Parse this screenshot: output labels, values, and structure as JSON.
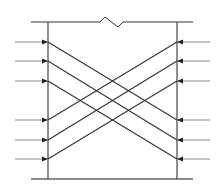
{
  "diagram": {
    "colors": {
      "line": "#333333",
      "stub": "#888888",
      "background": "#ffffff"
    },
    "rows": 6,
    "left_inputs": [
      "row-1",
      "row-2",
      "row-3",
      "row-4",
      "row-5",
      "row-6"
    ],
    "right_inputs": [
      "row-1",
      "row-2",
      "row-3",
      "row-4",
      "row-5",
      "row-6"
    ],
    "connections": [
      {
        "from": "left-row-1",
        "to": "right-row-4"
      },
      {
        "from": "left-row-2",
        "to": "right-row-5"
      },
      {
        "from": "left-row-3",
        "to": "right-row-6"
      },
      {
        "from": "left-row-4",
        "to": "right-row-1"
      },
      {
        "from": "left-row-5",
        "to": "right-row-2"
      },
      {
        "from": "left-row-6",
        "to": "right-row-3"
      }
    ],
    "top_boundary_has_break_symbol": true
  }
}
